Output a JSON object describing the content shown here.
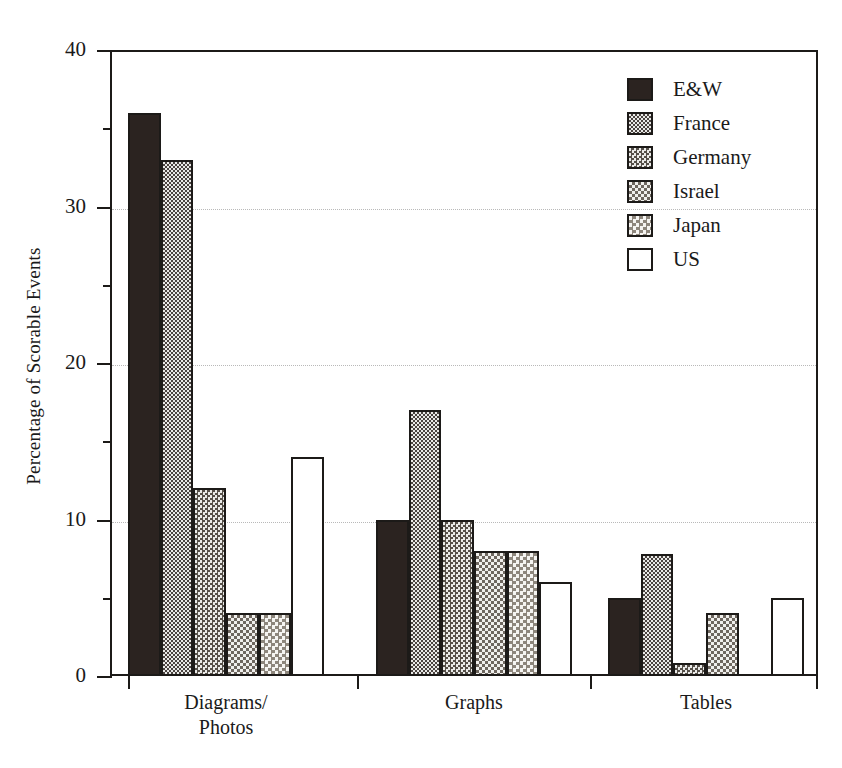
{
  "chart_data": {
    "type": "bar",
    "title": "",
    "xlabel": "",
    "ylabel": "Percentage of Scorable Events",
    "categories": [
      "Diagrams/\nPhotos",
      "Graphs",
      "Tables"
    ],
    "series": [
      {
        "name": "E&W",
        "values": [
          36,
          10,
          5
        ]
      },
      {
        "name": "France",
        "values": [
          33,
          17,
          7.8
        ]
      },
      {
        "name": "Germany",
        "values": [
          12,
          10,
          0.8
        ]
      },
      {
        "name": "Israel",
        "values": [
          4,
          8,
          4
        ]
      },
      {
        "name": "Japan",
        "values": [
          4,
          8,
          0
        ]
      },
      {
        "name": "US",
        "values": [
          14,
          6,
          5
        ]
      }
    ],
    "ylim": [
      0,
      40
    ],
    "ytick_labels": [
      "0",
      "10",
      "20",
      "30",
      "40"
    ],
    "ytick_values": [
      0,
      10,
      20,
      30,
      40
    ],
    "yminor_values": [
      5,
      15,
      25,
      35
    ],
    "gridlines": [
      10,
      20,
      30
    ],
    "grid": true,
    "legend_position": "top-right",
    "legend_entries": [
      {
        "label": "E&W",
        "pattern": "solid-black",
        "swatch_class": "fill-p0"
      },
      {
        "label": "France",
        "pattern": "checker-dense",
        "swatch_class": "fill-p1"
      },
      {
        "label": "Germany",
        "pattern": "checker-medium",
        "swatch_class": "fill-p2"
      },
      {
        "label": "Israel",
        "pattern": "checker-light",
        "swatch_class": "fill-p3"
      },
      {
        "label": "Japan",
        "pattern": "checker-faint",
        "swatch_class": "fill-p4"
      },
      {
        "label": "US",
        "pattern": "empty-white",
        "swatch_class": "fill-p5"
      }
    ],
    "colors": {
      "bar_outline": "#1c1a18",
      "solid_fill": "#2b2320",
      "axis": "#1c1a18",
      "gridline": "#b9b9b9",
      "background": "#ffffff"
    }
  }
}
